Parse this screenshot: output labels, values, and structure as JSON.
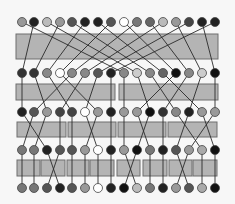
{
  "diagram": {
    "type": "butterfly-sorting-network",
    "node_x": [
      22,
      34,
      47,
      60,
      72,
      85,
      98,
      111,
      124,
      137,
      150,
      163,
      176,
      189,
      202,
      215
    ],
    "rows_y": [
      22,
      73,
      112,
      150,
      188
    ],
    "node_radius": 4.5,
    "rows": [
      [
        "#999999",
        "#222222",
        "#bbbbbb",
        "#999999",
        "#555555",
        "#222222",
        "#222222",
        "#555555",
        "#ffffff",
        "#777777",
        "#666666",
        "#bbbbbb",
        "#999999",
        "#444444",
        "#222222",
        "#222222"
      ],
      [
        "#333333",
        "#333333",
        "#888888",
        "#ffffff",
        "#888888",
        "#888888",
        "#555555",
        "#222222",
        "#888888",
        "#cccccc",
        "#888888",
        "#666666",
        "#111111",
        "#888888",
        "#cccccc",
        "#111111"
      ],
      [
        "#222222",
        "#555555",
        "#999999",
        "#444444",
        "#444444",
        "#ffffff",
        "#999999",
        "#222222",
        "#999999",
        "#999999",
        "#111111",
        "#333333",
        "#888888",
        "#222222",
        "#999999",
        "#999999"
      ],
      [
        "#777777",
        "#777777",
        "#222222",
        "#555555",
        "#555555",
        "#999999",
        "#ffffff",
        "#222222",
        "#999999",
        "#111111",
        "#777777",
        "#222222",
        "#555555",
        "#999999",
        "#aaaaaa",
        "#111111"
      ],
      [
        "#777777",
        "#777777",
        "#555555",
        "#222222",
        "#555555",
        "#999999",
        "#ffffff",
        "#222222",
        "#111111",
        "#bbbbbb",
        "#777777",
        "#222222",
        "#999999",
        "#555555",
        "#aaaaaa",
        "#111111"
      ]
    ],
    "stages": [
      {
        "boxes": [
          {
            "x": 16,
            "y": 34,
            "w": 202,
            "h": 25
          }
        ],
        "mapping": [
          8,
          0,
          9,
          1,
          10,
          2,
          11,
          3,
          12,
          4,
          13,
          5,
          14,
          6,
          15,
          7
        ]
      },
      {
        "boxes": [
          {
            "x": 16,
            "y": 84,
            "w": 99,
            "h": 16
          },
          {
            "x": 119,
            "y": 84,
            "w": 99,
            "h": 16
          }
        ],
        "mapping": [
          0,
          2,
          4,
          6,
          1,
          3,
          5,
          7,
          8,
          10,
          12,
          14,
          9,
          11,
          13,
          15
        ]
      },
      {
        "boxes": [
          {
            "x": 17,
            "y": 122,
            "w": 49,
            "h": 15
          },
          {
            "x": 68,
            "y": 122,
            "w": 48,
            "h": 15
          },
          {
            "x": 118,
            "y": 122,
            "w": 48,
            "h": 15
          },
          {
            "x": 168,
            "y": 122,
            "w": 49,
            "h": 15
          }
        ],
        "mapping": [
          2,
          0,
          1,
          3,
          4,
          6,
          5,
          7,
          8,
          10,
          9,
          11,
          14,
          12,
          15,
          13
        ]
      },
      {
        "boxes": [
          {
            "x": 17,
            "y": 160,
            "w": 23,
            "h": 16
          },
          {
            "x": 41,
            "y": 160,
            "w": 24,
            "h": 16
          },
          {
            "x": 67,
            "y": 160,
            "w": 22,
            "h": 16
          },
          {
            "x": 90,
            "y": 160,
            "w": 24,
            "h": 16
          },
          {
            "x": 117,
            "y": 160,
            "w": 23,
            "h": 16
          },
          {
            "x": 143,
            "y": 160,
            "w": 24,
            "h": 16
          },
          {
            "x": 169,
            "y": 160,
            "w": 23,
            "h": 16
          },
          {
            "x": 193,
            "y": 160,
            "w": 24,
            "h": 16
          }
        ],
        "mapping": [
          0,
          1,
          3,
          2,
          4,
          5,
          6,
          7,
          9,
          8,
          10,
          11,
          13,
          12,
          14,
          15
        ]
      }
    ],
    "colors": {
      "box_fill": "#b4b4b4",
      "box_stroke": "#6e6e6e",
      "wire": "#2a2a2a",
      "node_stroke": "#444444",
      "background": "#f7f7f7"
    }
  }
}
